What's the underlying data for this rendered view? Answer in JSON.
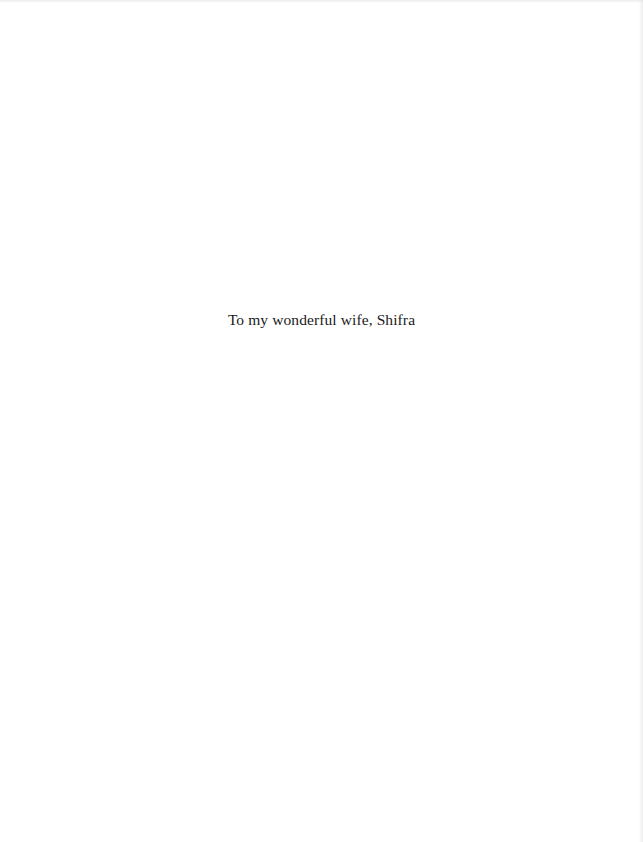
{
  "page": {
    "dedication": "To my wonderful wife, Shifra"
  }
}
